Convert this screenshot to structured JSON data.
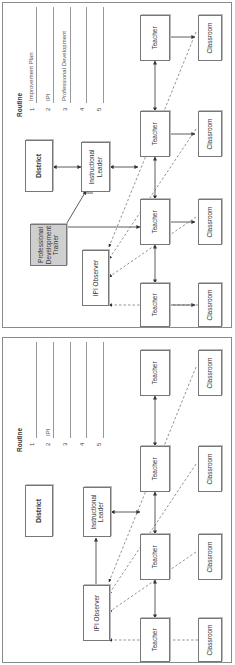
{
  "panels": [
    {
      "id": "with-trainer",
      "district": "District",
      "instructional_leader": "Instructional Leader",
      "ipi_observer": "IPI Observer",
      "trainer": "Professional Development Trainer",
      "teachers": [
        "Teacher",
        "Teacher",
        "Teacher",
        "Teacher"
      ],
      "classrooms": [
        "Classroom",
        "Classroom",
        "Classroom",
        "Classroom"
      ],
      "routine": {
        "title": "Routine",
        "items": [
          {
            "num": "1",
            "text": "Improvement Plan"
          },
          {
            "num": "2",
            "text": "IPI"
          },
          {
            "num": "3",
            "text": "Professional Development"
          },
          {
            "num": "4",
            "text": ""
          },
          {
            "num": "5",
            "text": ""
          }
        ]
      }
    },
    {
      "id": "without-trainer",
      "district": "District",
      "instructional_leader": "Instructional Leader",
      "ipi_observer": "IPI Observer",
      "teachers": [
        "Teacher",
        "Teacher",
        "Teacher",
        "Teacher"
      ],
      "classrooms": [
        "Classroom",
        "Classroom",
        "Classroom",
        "Classroom"
      ],
      "routine": {
        "title": "Routine",
        "items": [
          {
            "num": "1",
            "text": ""
          },
          {
            "num": "2",
            "text": "IPI"
          },
          {
            "num": "3",
            "text": ""
          },
          {
            "num": "4",
            "text": ""
          },
          {
            "num": "5",
            "text": ""
          }
        ]
      }
    }
  ],
  "colors": {
    "border": "#777777",
    "trainer_fill": "#cfcfcf",
    "line": "#333333",
    "dashed": "#666666"
  }
}
